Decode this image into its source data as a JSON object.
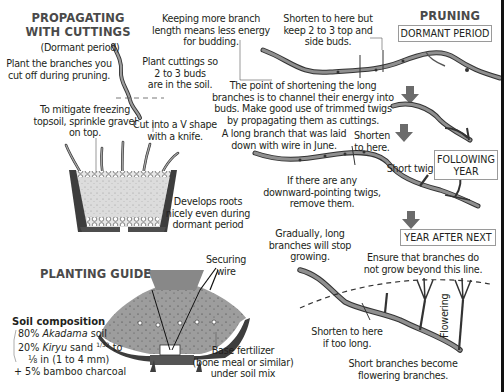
{
  "propagating": {
    "title_line1": "PROPAGATING",
    "title_line2": "WITH CUTTINGS",
    "subtitle": "(Dormant period)",
    "note_plant_branches": [
      "Plant the branches you",
      "cut off during pruning."
    ],
    "note_plant_cuttings": [
      "Plant cuttings so",
      "2 to 3 buds",
      "are in the soil."
    ],
    "note_gravel": [
      "To mitigate freezing",
      "topsoil, sprinkle gravel",
      "on top."
    ],
    "note_v_cut": [
      "Cut into a V shape",
      "with a knife."
    ],
    "note_roots": [
      "Develops roots",
      "nicely even during",
      "dormant period"
    ]
  },
  "pruning": {
    "title": "PRUNING",
    "stage_dormant": "DORMANT PERIOD",
    "stage_following": [
      "FOLLOWING",
      "YEAR"
    ],
    "stage_after_next": "YEAR AFTER NEXT",
    "note_keep_length": [
      "Keeping more branch",
      "length means less energy",
      "for budding."
    ],
    "note_shorten_keep": [
      "Shorten to here but",
      "keep 2 to 3 top and",
      "side buds."
    ],
    "note_point": [
      "The point of shortening the long",
      "branches is to channel their energy into",
      "buds. Make good use of trimmed twigs",
      "by propagating them as cuttings."
    ],
    "note_long_branch": [
      "A long branch that was laid",
      "down with wire in June."
    ],
    "note_shorten_here": [
      "Shorten",
      "to here."
    ],
    "note_short_twig": "Short twig",
    "note_downward": [
      "If there are any",
      "downward-pointing twigs,",
      "remove them."
    ],
    "note_gradually": [
      "Gradually, long",
      "branches will stop",
      "growing."
    ],
    "note_ensure": [
      "Ensure that branches do",
      "not grow beyond this line."
    ],
    "note_flowering_vertical": "Flowering",
    "note_shorten_too_long": [
      "Shorten to here",
      "if too long."
    ],
    "note_short_branches": [
      "Short branches become",
      "flowering branches."
    ]
  },
  "planting": {
    "title": "PLANTING GUIDE",
    "note_securing_wire": [
      "Securing",
      "wire"
    ],
    "note_base_fertilizer": [
      "Base fertilizer",
      "(bone meal or similar)",
      "under soil mix"
    ],
    "soil_composition": {
      "title": "Soil composition",
      "line1_pct": "80% ",
      "line1_italic": "Akadama",
      "line1_rest": " soil",
      "line2_pct": "20% ",
      "line2_italic": "Kiryu",
      "line2_rest": " sand ",
      "line2_frac": "1/32",
      "line2_end": " to",
      "line3": "⅛ in (1 to 4 mm)",
      "line4": "+ 5% bamboo charcoal"
    }
  },
  "colors": {
    "text": "#231f20",
    "heading": "#4a4a4a",
    "branch_fill": "#8a8a8a",
    "arrow": "#6b6b6b",
    "soil": "#d9d9d9",
    "pot": "#4d4d4d"
  }
}
